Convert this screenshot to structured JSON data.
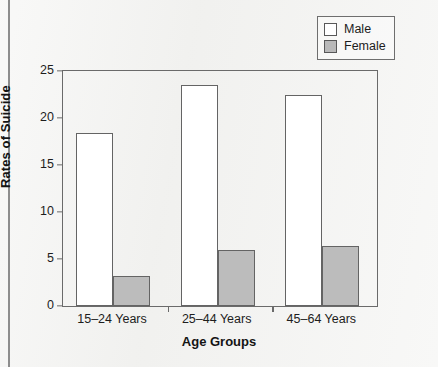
{
  "chart_data": {
    "type": "bar",
    "title": "",
    "xlabel": "Age Groups",
    "ylabel": "Rates of Suicide",
    "categories": [
      "15–24 Years",
      "25–44 Years",
      "45–64 Years"
    ],
    "series": [
      {
        "name": "Male",
        "values": [
          18.4,
          23.5,
          22.4
        ],
        "color": "#ffffff"
      },
      {
        "name": "Female",
        "values": [
          3.2,
          6.0,
          6.4
        ],
        "color": "#bcbcbc"
      }
    ],
    "ylim": [
      0,
      25
    ],
    "yticks": [
      0,
      5,
      10,
      15,
      20,
      25
    ],
    "ytick_labels": [
      "0",
      "5",
      "10",
      "15",
      "20",
      "25"
    ],
    "grid": false,
    "legend_position": "top-right"
  },
  "legend": {
    "entries": [
      {
        "label": "Male",
        "swatch": "white-square"
      },
      {
        "label": "Female",
        "swatch": "gray-square"
      }
    ]
  },
  "caption": {
    "text": ""
  }
}
